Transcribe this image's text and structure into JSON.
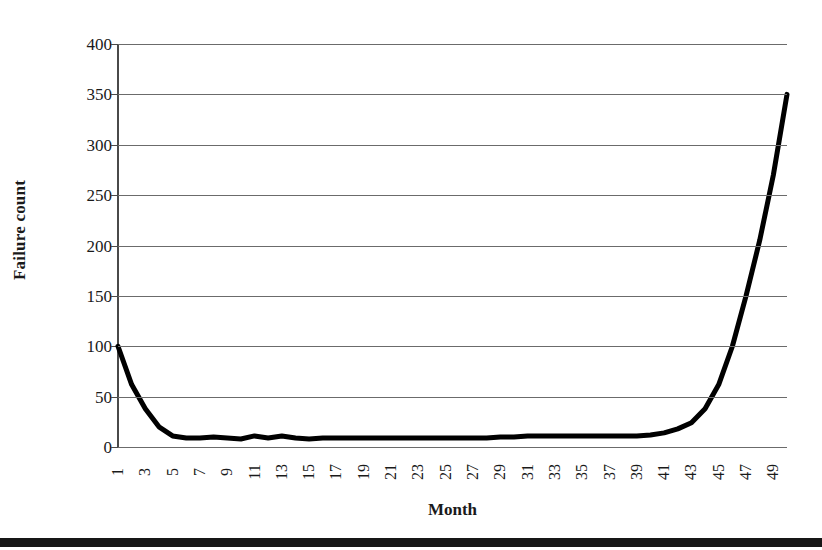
{
  "chart_data": {
    "type": "line",
    "title": "",
    "xlabel": "Month",
    "ylabel": "Failure count",
    "xlim": [
      1,
      50
    ],
    "ylim": [
      0,
      400
    ],
    "yticks": [
      0,
      50,
      100,
      150,
      200,
      250,
      300,
      350,
      400
    ],
    "xticks": [
      1,
      3,
      5,
      7,
      9,
      11,
      13,
      15,
      17,
      19,
      21,
      23,
      25,
      27,
      29,
      31,
      33,
      35,
      37,
      39,
      41,
      43,
      45,
      47,
      49
    ],
    "grid": true,
    "legend": false,
    "line_color": "#000000",
    "line_width": 5,
    "series": [
      {
        "name": "Failure count",
        "x": [
          1,
          2,
          3,
          4,
          5,
          6,
          7,
          8,
          9,
          10,
          11,
          12,
          13,
          14,
          15,
          16,
          17,
          18,
          19,
          20,
          21,
          22,
          23,
          24,
          25,
          26,
          27,
          28,
          29,
          30,
          31,
          32,
          33,
          34,
          35,
          36,
          37,
          38,
          39,
          40,
          41,
          42,
          43,
          44,
          45,
          46,
          47,
          48,
          49,
          50
        ],
        "values": [
          100,
          62,
          38,
          20,
          11,
          9,
          9,
          10,
          9,
          8,
          11,
          9,
          11,
          9,
          8,
          9,
          9,
          9,
          9,
          9,
          9,
          9,
          9,
          9,
          9,
          9,
          9,
          9,
          10,
          10,
          11,
          11,
          11,
          11,
          11,
          11,
          11,
          11,
          11,
          12,
          14,
          18,
          24,
          38,
          62,
          100,
          150,
          205,
          270,
          350
        ]
      }
    ]
  },
  "axes": {
    "y_title": "Failure count",
    "x_title": "Month",
    "y_tick_labels": [
      "400",
      "350",
      "300",
      "250",
      "200",
      "150",
      "100",
      "50",
      "0"
    ],
    "x_tick_labels": [
      "1",
      "3",
      "5",
      "7",
      "9",
      "11",
      "13",
      "15",
      "17",
      "19",
      "21",
      "23",
      "25",
      "27",
      "29",
      "31",
      "33",
      "35",
      "37",
      "39",
      "41",
      "43",
      "45",
      "47",
      "49"
    ]
  },
  "colors": {
    "line": "#000000",
    "gridline": "#6b6b6b",
    "axis": "#4a4a4a",
    "text": "#1a1a1a",
    "background": "#ffffff",
    "page_edge": "#171717"
  }
}
